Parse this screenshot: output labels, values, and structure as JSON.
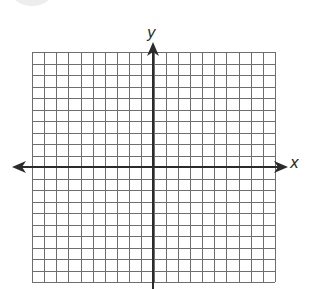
{
  "diagram": {
    "type": "coordinate-grid",
    "x_axis_label": "x",
    "y_axis_label": "y",
    "grid": {
      "columns": 20,
      "rows": 20,
      "left": 32,
      "top": 52,
      "cell_width": 12.15,
      "cell_height": 11.5,
      "line_color": "#6e6e6e",
      "axis_color": "#2b2b2b"
    },
    "origin": {
      "x": 153,
      "y": 167
    },
    "x_axis": {
      "from": 12,
      "to": 288,
      "arrows": "both"
    },
    "y_axis": {
      "from": 289,
      "to": 42,
      "arrows": "up"
    }
  }
}
